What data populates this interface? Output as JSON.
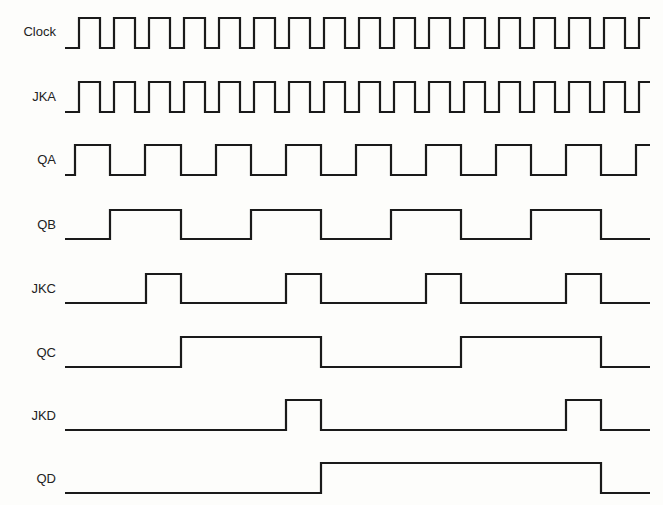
{
  "diagram": {
    "type": "timing_diagram",
    "x_start": 65,
    "x_end": 650,
    "signals": [
      {
        "label": "Clock",
        "y_high": 18,
        "y_low": 48,
        "start_level": 0,
        "edges": [
          79,
          100,
          114,
          135,
          149,
          170,
          184,
          205,
          219,
          240,
          254,
          275,
          289,
          310,
          324,
          345,
          359,
          380,
          394,
          415,
          429,
          450,
          464,
          485,
          499,
          520,
          534,
          555,
          569,
          590,
          604,
          625,
          639
        ]
      },
      {
        "label": "JKA",
        "y_high": 82,
        "y_low": 112,
        "start_level": 0,
        "edges": [
          79,
          100,
          114,
          135,
          149,
          170,
          184,
          205,
          219,
          240,
          254,
          275,
          289,
          310,
          324,
          345,
          359,
          380,
          394,
          415,
          429,
          450,
          464,
          485,
          499,
          520,
          534,
          555,
          569,
          590,
          604,
          625,
          639
        ]
      },
      {
        "label": "QA",
        "y_high": 145,
        "y_low": 175,
        "start_level": 0,
        "edges": [
          75,
          110,
          145,
          181,
          216,
          251,
          286,
          321,
          356,
          391,
          426,
          461,
          496,
          531,
          566,
          601,
          636
        ]
      },
      {
        "label": "QB",
        "y_high": 210,
        "y_low": 239,
        "start_level": 0,
        "edges": [
          110,
          181,
          251,
          321,
          391,
          461,
          531,
          601
        ]
      },
      {
        "label": "JKC",
        "y_high": 274,
        "y_low": 303,
        "start_level": 0,
        "edges": [
          146,
          181,
          286,
          321,
          426,
          461,
          566,
          601
        ]
      },
      {
        "label": "QC",
        "y_high": 337,
        "y_low": 367,
        "start_level": 0,
        "edges": [
          181,
          321,
          461,
          601
        ]
      },
      {
        "label": "JKD",
        "y_high": 400,
        "y_low": 430,
        "start_level": 0,
        "edges": [
          286,
          321,
          566,
          601
        ]
      },
      {
        "label": "QD",
        "y_high": 463,
        "y_low": 493,
        "start_level": 0,
        "edges": [
          321,
          601
        ]
      }
    ]
  }
}
